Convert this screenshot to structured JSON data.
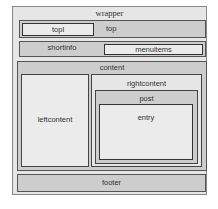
{
  "diagram": {
    "type": "layout-wireframe",
    "boxes": {
      "wrapper": "wrapper",
      "top": "top",
      "topl": "topl",
      "shortinfo": "shortinfo",
      "menuitems": "menuitems",
      "content": "content",
      "leftcontent": "leftcontent",
      "rightcontent": "rightcontent",
      "post": "post",
      "entry": "entry",
      "footer": "footer"
    },
    "hierarchy": {
      "wrapper": [
        "top",
        "shortinfo",
        "content",
        "footer"
      ],
      "top": [
        "topl"
      ],
      "shortinfo": [
        "menuitems"
      ],
      "content": [
        "leftcontent",
        "rightcontent"
      ],
      "rightcontent": [
        "post"
      ],
      "post": [
        "entry"
      ]
    },
    "colors": {
      "outer_fill": "#e6e6e6",
      "bar_fill": "#cdcdcd",
      "inner_fill": "#ebebeb",
      "border": "#555555"
    }
  }
}
